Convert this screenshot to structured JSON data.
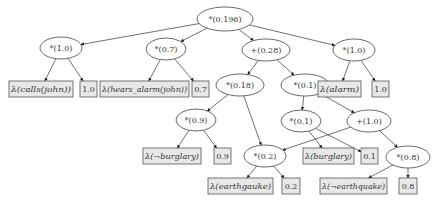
{
  "diagram": {
    "type": "arithmetic-circuit-tree",
    "colors": {
      "node_stroke": "#444444",
      "leaf_fill": "#e8e8e8",
      "edge": "#333333"
    },
    "nodes": [
      {
        "id": "root",
        "label": "*(0.196)",
        "shape": "ellipse",
        "cx": 225,
        "cy": 19,
        "rx": 28,
        "ry": 12
      },
      {
        "id": "n1",
        "label": "*(1.0)",
        "shape": "ellipse",
        "cx": 61,
        "cy": 48,
        "rx": 21,
        "ry": 11
      },
      {
        "id": "n2",
        "label": "*(0.7)",
        "shape": "ellipse",
        "cx": 166,
        "cy": 49,
        "rx": 20,
        "ry": 11
      },
      {
        "id": "n3",
        "label": "+(0.28)",
        "shape": "ellipse",
        "cx": 266,
        "cy": 50,
        "rx": 24,
        "ry": 11
      },
      {
        "id": "n4",
        "label": "*(1.0)",
        "shape": "ellipse",
        "cx": 354,
        "cy": 50,
        "rx": 21,
        "ry": 11
      },
      {
        "id": "n5",
        "label": "*(0.18)",
        "shape": "ellipse",
        "cx": 240,
        "cy": 85,
        "rx": 24,
        "ry": 11
      },
      {
        "id": "n6",
        "label": "*(0.1)",
        "shape": "ellipse",
        "cx": 305,
        "cy": 85,
        "rx": 24,
        "ry": 11
      },
      {
        "id": "n7",
        "label": "*(0.9)",
        "shape": "ellipse",
        "cx": 196,
        "cy": 120,
        "rx": 20,
        "ry": 11
      },
      {
        "id": "n8",
        "label": "*(0.1)",
        "shape": "ellipse",
        "cx": 301,
        "cy": 121,
        "rx": 20,
        "ry": 11
      },
      {
        "id": "n9",
        "label": "+(1.0)",
        "shape": "ellipse",
        "cx": 369,
        "cy": 121,
        "rx": 22,
        "ry": 11
      },
      {
        "id": "n10",
        "label": "*(0.2)",
        "shape": "ellipse",
        "cx": 265,
        "cy": 156,
        "rx": 21,
        "ry": 11
      },
      {
        "id": "n11",
        "label": "*(0.8)",
        "shape": "ellipse",
        "cx": 408,
        "cy": 157,
        "rx": 22,
        "ry": 11
      }
    ],
    "leaves": [
      {
        "id": "l1",
        "label": "λ(calls(john))",
        "x": 9,
        "y": 81,
        "w": 64,
        "h": 16,
        "italic": true
      },
      {
        "id": "l2",
        "label": "1.0",
        "x": 80,
        "y": 81,
        "w": 17,
        "h": 16,
        "italic": false
      },
      {
        "id": "l3",
        "label": "λ(hears_alarm(john))",
        "x": 100,
        "y": 81,
        "w": 89,
        "h": 16,
        "italic": true
      },
      {
        "id": "l4",
        "label": "0.7",
        "x": 192,
        "y": 81,
        "w": 17,
        "h": 16,
        "italic": false
      },
      {
        "id": "l5",
        "label": "λ(alarm)",
        "x": 318,
        "y": 81,
        "w": 43,
        "h": 16,
        "italic": true
      },
      {
        "id": "l6",
        "label": "1.0",
        "x": 372,
        "y": 81,
        "w": 17,
        "h": 16,
        "italic": false
      },
      {
        "id": "l7",
        "label": "λ(¬burglary)",
        "x": 143,
        "y": 148,
        "w": 58,
        "h": 16,
        "italic": true
      },
      {
        "id": "l8",
        "label": "0.9",
        "x": 214,
        "y": 148,
        "w": 17,
        "h": 16,
        "italic": false
      },
      {
        "id": "l9",
        "label": "λ(burglary)",
        "x": 303,
        "y": 148,
        "w": 51,
        "h": 16,
        "italic": true
      },
      {
        "id": "l10",
        "label": "0.1",
        "x": 361,
        "y": 148,
        "w": 17,
        "h": 16,
        "italic": false
      },
      {
        "id": "l11",
        "label": "λ(earthgauke)",
        "x": 208,
        "y": 178,
        "w": 65,
        "h": 16,
        "italic": true
      },
      {
        "id": "l12",
        "label": "0.2",
        "x": 282,
        "y": 178,
        "w": 18,
        "h": 16,
        "italic": false
      },
      {
        "id": "l13",
        "label": "λ(¬earthquake)",
        "x": 320,
        "y": 178,
        "w": 67,
        "h": 16,
        "italic": true
      },
      {
        "id": "l14",
        "label": "0.8",
        "x": 399,
        "y": 178,
        "w": 18,
        "h": 16,
        "italic": false
      }
    ],
    "edges": [
      [
        "root",
        "n1"
      ],
      [
        "root",
        "n2"
      ],
      [
        "root",
        "n3"
      ],
      [
        "root",
        "n4"
      ],
      [
        "n1",
        "l1"
      ],
      [
        "n1",
        "l2"
      ],
      [
        "n2",
        "l3"
      ],
      [
        "n2",
        "l4"
      ],
      [
        "n3",
        "n5"
      ],
      [
        "n3",
        "n6"
      ],
      [
        "n4",
        "l5"
      ],
      [
        "n4",
        "l6"
      ],
      [
        "n5",
        "n7"
      ],
      [
        "n5",
        "n10"
      ],
      [
        "n6",
        "n8"
      ],
      [
        "n6",
        "n9"
      ],
      [
        "n7",
        "l7"
      ],
      [
        "n7",
        "l8"
      ],
      [
        "n8",
        "l9"
      ],
      [
        "n8",
        "l10"
      ],
      [
        "n9",
        "n10"
      ],
      [
        "n9",
        "n11"
      ],
      [
        "n10",
        "l11"
      ],
      [
        "n10",
        "l12"
      ],
      [
        "n11",
        "l13"
      ],
      [
        "n11",
        "l14"
      ]
    ]
  }
}
